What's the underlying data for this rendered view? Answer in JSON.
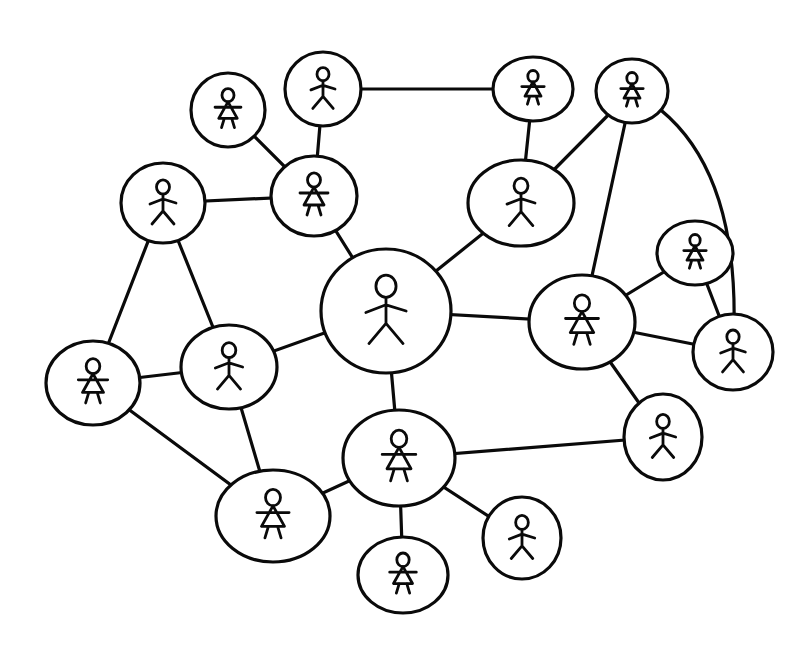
{
  "diagram": {
    "type": "social-network",
    "style": "hand-drawn",
    "colors": {
      "ink": "#0a0a0a",
      "background": "#ffffff"
    },
    "nodes": [
      {
        "id": "n1",
        "figure": "female",
        "cx": 228,
        "cy": 110,
        "rx": 37,
        "ry": 37
      },
      {
        "id": "n2",
        "figure": "male",
        "cx": 323,
        "cy": 89,
        "rx": 38,
        "ry": 37
      },
      {
        "id": "n3",
        "figure": "female",
        "cx": 533,
        "cy": 89,
        "rx": 40,
        "ry": 32
      },
      {
        "id": "n4",
        "figure": "female",
        "cx": 632,
        "cy": 91,
        "rx": 36,
        "ry": 32
      },
      {
        "id": "n5",
        "figure": "male",
        "cx": 163,
        "cy": 203,
        "rx": 42,
        "ry": 40
      },
      {
        "id": "n6",
        "figure": "female",
        "cx": 314,
        "cy": 196,
        "rx": 43,
        "ry": 40
      },
      {
        "id": "n7",
        "figure": "male",
        "cx": 521,
        "cy": 203,
        "rx": 53,
        "ry": 43
      },
      {
        "id": "n8",
        "figure": "male",
        "cx": 386,
        "cy": 311,
        "rx": 65,
        "ry": 62
      },
      {
        "id": "n9",
        "figure": "female",
        "cx": 695,
        "cy": 253,
        "rx": 38,
        "ry": 32
      },
      {
        "id": "n10",
        "figure": "female",
        "cx": 582,
        "cy": 322,
        "rx": 53,
        "ry": 47
      },
      {
        "id": "n11",
        "figure": "male",
        "cx": 733,
        "cy": 352,
        "rx": 40,
        "ry": 38
      },
      {
        "id": "n12",
        "figure": "female",
        "cx": 93,
        "cy": 383,
        "rx": 47,
        "ry": 42
      },
      {
        "id": "n13",
        "figure": "male",
        "cx": 229,
        "cy": 367,
        "rx": 48,
        "ry": 42
      },
      {
        "id": "n14",
        "figure": "male",
        "cx": 663,
        "cy": 437,
        "rx": 39,
        "ry": 43
      },
      {
        "id": "n15",
        "figure": "female",
        "cx": 399,
        "cy": 458,
        "rx": 56,
        "ry": 48
      },
      {
        "id": "n16",
        "figure": "female",
        "cx": 273,
        "cy": 516,
        "rx": 57,
        "ry": 46
      },
      {
        "id": "n17",
        "figure": "male",
        "cx": 522,
        "cy": 538,
        "rx": 39,
        "ry": 41
      },
      {
        "id": "n18",
        "figure": "female",
        "cx": 403,
        "cy": 575,
        "rx": 45,
        "ry": 38
      }
    ],
    "edges": [
      [
        "n1",
        "n6"
      ],
      [
        "n2",
        "n6"
      ],
      [
        "n2",
        "n3"
      ],
      [
        "n3",
        "n7"
      ],
      [
        "n7",
        "n4"
      ],
      [
        "n4",
        "n10"
      ],
      [
        "n4",
        "n11"
      ],
      [
        "n5",
        "n6"
      ],
      [
        "n5",
        "n12"
      ],
      [
        "n5",
        "n13"
      ],
      [
        "n6",
        "n8"
      ],
      [
        "n7",
        "n8"
      ],
      [
        "n8",
        "n10"
      ],
      [
        "n8",
        "n13"
      ],
      [
        "n8",
        "n15"
      ],
      [
        "n10",
        "n9"
      ],
      [
        "n10",
        "n11"
      ],
      [
        "n9",
        "n11"
      ],
      [
        "n10",
        "n14"
      ],
      [
        "n12",
        "n13"
      ],
      [
        "n12",
        "n16"
      ],
      [
        "n13",
        "n16"
      ],
      [
        "n15",
        "n16"
      ],
      [
        "n15",
        "n14"
      ],
      [
        "n15",
        "n17"
      ],
      [
        "n15",
        "n18"
      ]
    ],
    "curved_edges": {
      "n4-n11": {
        "cx": 745,
        "cy": 150
      }
    }
  }
}
